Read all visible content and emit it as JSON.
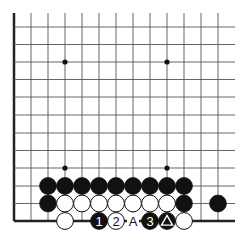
{
  "diagram": {
    "type": "go-board-fragment",
    "grid": {
      "columns_x": [
        14,
        31,
        48,
        65,
        82,
        99,
        116,
        133,
        150,
        167,
        184,
        201,
        218
      ],
      "rows_y": [
        27,
        44.5,
        62,
        79.5,
        97,
        115,
        133,
        150.5,
        168,
        186,
        203.5,
        221
      ],
      "right_end": 235,
      "top_start": 13,
      "line_color": "#555555",
      "edge_color": "#222222"
    },
    "star_points": [
      [
        65,
        62
      ],
      [
        167,
        62
      ],
      [
        65,
        168
      ],
      [
        167,
        168
      ]
    ],
    "stones": [
      {
        "color": "black",
        "x": 48,
        "y": 186
      },
      {
        "color": "black",
        "x": 65,
        "y": 186
      },
      {
        "color": "black",
        "x": 82,
        "y": 186
      },
      {
        "color": "black",
        "x": 99,
        "y": 186
      },
      {
        "color": "black",
        "x": 116,
        "y": 186
      },
      {
        "color": "black",
        "x": 133,
        "y": 186
      },
      {
        "color": "black",
        "x": 150,
        "y": 186
      },
      {
        "color": "black",
        "x": 167,
        "y": 186
      },
      {
        "color": "black",
        "x": 184,
        "y": 186
      },
      {
        "color": "black",
        "x": 48,
        "y": 203.5
      },
      {
        "color": "white",
        "x": 65,
        "y": 203.5
      },
      {
        "color": "white",
        "x": 82,
        "y": 203.5
      },
      {
        "color": "white",
        "x": 99,
        "y": 203.5
      },
      {
        "color": "white",
        "x": 116,
        "y": 203.5
      },
      {
        "color": "white",
        "x": 133,
        "y": 203.5
      },
      {
        "color": "white",
        "x": 150,
        "y": 203.5
      },
      {
        "color": "white",
        "x": 167,
        "y": 203.5
      },
      {
        "color": "black",
        "x": 184,
        "y": 203.5
      },
      {
        "color": "black",
        "x": 218,
        "y": 203.5
      },
      {
        "color": "white",
        "x": 65,
        "y": 221
      },
      {
        "color": "black",
        "x": 99,
        "y": 221,
        "label": "1"
      },
      {
        "color": "white",
        "x": 116,
        "y": 221,
        "label": "2"
      },
      {
        "color": "black",
        "x": 150,
        "y": 221,
        "label": "3"
      },
      {
        "color": "black",
        "x": 167,
        "y": 221,
        "marker": "triangle"
      },
      {
        "color": "white",
        "x": 184,
        "y": 221
      }
    ],
    "point_labels": [
      {
        "text": "A",
        "x": 133,
        "y": 221
      }
    ]
  }
}
